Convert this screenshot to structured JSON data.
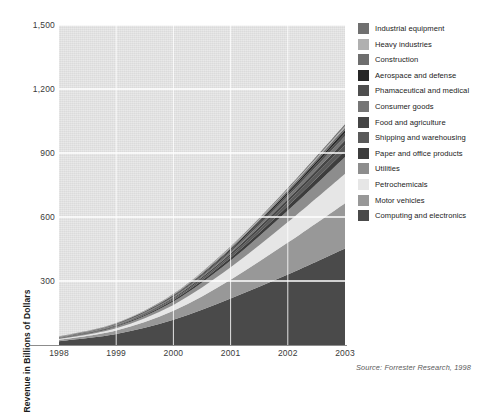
{
  "chart_data": {
    "type": "area",
    "stacked": true,
    "title": "",
    "xlabel": "",
    "ylabel": "Revenue in Billions of Dollars",
    "categories": [
      "1998",
      "1999",
      "2000",
      "2001",
      "2002",
      "2003"
    ],
    "x": [
      1998,
      1999,
      2000,
      2001,
      2002,
      2003
    ],
    "ylim": [
      0,
      1500
    ],
    "yticks": [
      "300",
      "600",
      "900",
      "1,200",
      "1,500"
    ],
    "ytick_values": [
      300,
      600,
      900,
      1200,
      1500
    ],
    "grid": "horizontal-and-vertical-white",
    "legend_position": "right",
    "source": "Source: Forrester Research, 1998",
    "series": [
      {
        "name": "Computing and electronics",
        "color": "#4a4a4a",
        "values": [
          18,
          52,
          118,
          218,
          330,
          452
        ]
      },
      {
        "name": "Motor vehicles",
        "color": "#989898",
        "values": [
          6,
          16,
          42,
          88,
          150,
          213
        ]
      },
      {
        "name": "Petrochemicals",
        "color": "#e6e6e6",
        "values": [
          4,
          11,
          28,
          58,
          96,
          138
        ]
      },
      {
        "name": "Utilities",
        "color": "#8d8d8d",
        "values": [
          3,
          7,
          16,
          32,
          54,
          78
        ]
      },
      {
        "name": "Paper and office products",
        "color": "#3d3d3d",
        "values": [
          1,
          3,
          7,
          13,
          21,
          30
        ]
      },
      {
        "name": "Shipping and warehousing",
        "color": "#5a5a5a",
        "values": [
          1,
          3,
          6,
          11,
          18,
          26
        ]
      },
      {
        "name": "Food and agriculture",
        "color": "#454545",
        "values": [
          1,
          2,
          5,
          9,
          15,
          22
        ]
      },
      {
        "name": "Consumer goods",
        "color": "#767676",
        "values": [
          1,
          2,
          4,
          8,
          13,
          19
        ]
      },
      {
        "name": "Phamaceutical and medical",
        "color": "#4f4f4f",
        "values": [
          1,
          2,
          4,
          7,
          11,
          16
        ]
      },
      {
        "name": "Aerospace and defense",
        "color": "#262626",
        "values": [
          1,
          2,
          3,
          6,
          9,
          13
        ]
      },
      {
        "name": "Construction",
        "color": "#6e6e6e",
        "values": [
          1,
          1,
          3,
          5,
          8,
          11
        ]
      },
      {
        "name": "Heavy industries",
        "color": "#b0b0b0",
        "values": [
          1,
          1,
          2,
          4,
          6,
          9
        ]
      },
      {
        "name": "Industrial equipment",
        "color": "#707070",
        "values": [
          1,
          1,
          2,
          3,
          5,
          8
        ]
      }
    ]
  },
  "legend": {
    "items": [
      {
        "label": "Industrial equipment",
        "color": "#707070"
      },
      {
        "label": "Heavy industries",
        "color": "#b0b0b0"
      },
      {
        "label": "Construction",
        "color": "#6e6e6e"
      },
      {
        "label": "Aerospace and defense",
        "color": "#262626"
      },
      {
        "label": "Phamaceutical and medical",
        "color": "#4f4f4f"
      },
      {
        "label": "Consumer goods",
        "color": "#767676"
      },
      {
        "label": "Food and agriculture",
        "color": "#454545"
      },
      {
        "label": "Shipping and warehousing",
        "color": "#5a5a5a"
      },
      {
        "label": "Paper and office products",
        "color": "#3d3d3d"
      },
      {
        "label": "Utilities",
        "color": "#8d8d8d"
      },
      {
        "label": "Petrochemicals",
        "color": "#e6e6e6"
      },
      {
        "label": "Motor vehicles",
        "color": "#989898"
      },
      {
        "label": "Computing and electronics",
        "color": "#4a4a4a"
      }
    ]
  },
  "footer": {
    "source": "Source: Forrester Research, 1998"
  },
  "colors": {
    "plot_background": "#e2e2e2",
    "gridline": "#ffffff",
    "axis": "#8c8c8c",
    "text": "#3a3a3a"
  }
}
